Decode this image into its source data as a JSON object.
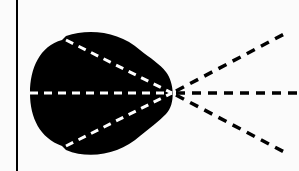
{
  "diagram": {
    "colors": {
      "background": "#fbfbfb",
      "lobe": "#000000",
      "inner_dash": "#ffffff",
      "outer_dash": "#000000",
      "reference_line": "#000000"
    },
    "focal_point": {
      "x": 172,
      "y": 93
    },
    "reference_line_x": 17,
    "rays": [
      {
        "name": "upper",
        "inner_start": [
          64,
          40
        ],
        "outer_end": [
          287,
          30
        ]
      },
      {
        "name": "center",
        "inner_start": [
          30,
          93
        ],
        "outer_end": [
          299,
          93
        ]
      },
      {
        "name": "lower",
        "inner_start": [
          64,
          147
        ],
        "outer_end": [
          287,
          157
        ]
      }
    ]
  }
}
